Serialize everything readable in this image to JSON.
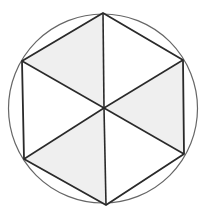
{
  "diagram": {
    "colors": {
      "background": "#ffffff",
      "circle_stroke": "#666666",
      "edge_stroke": "#2a2a2a",
      "shaded_fill": "#efefef",
      "unshaded_fill": "#ffffff"
    },
    "circle": {
      "cx": 103,
      "cy": 108.5,
      "r": 94.5
    },
    "center": [
      104,
      108
    ],
    "vertices": [
      [
        103,
        13
      ],
      [
        183,
        60
      ],
      [
        184,
        154
      ],
      [
        106,
        205
      ],
      [
        24,
        159
      ],
      [
        22,
        61
      ]
    ],
    "shaded_triangles": [
      5,
      1,
      3
    ]
  }
}
